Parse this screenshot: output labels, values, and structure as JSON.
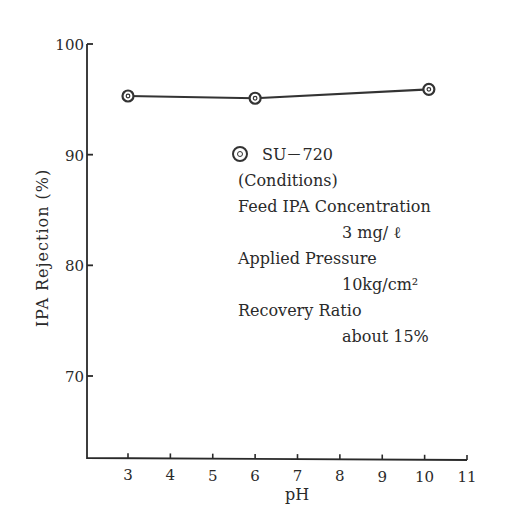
{
  "chart_data": {
    "type": "line",
    "title": "",
    "xlabel": "pH",
    "ylabel": "IPA Rejection (%)",
    "xlim": [
      2,
      11
    ],
    "ylim": [
      62.5,
      100
    ],
    "x_ticks": [
      "3",
      "4",
      "5",
      "6",
      "7",
      "8",
      "9",
      "10",
      "11"
    ],
    "y_ticks": [
      "100",
      "90",
      "80",
      "70"
    ],
    "grid": false,
    "legend_position": "inside-center-right",
    "series": [
      {
        "name": "SU-720",
        "marker": "double-circle",
        "x": [
          3,
          6,
          10.1
        ],
        "values": [
          95.3,
          95.1,
          95.9
        ]
      }
    ],
    "annotations": [
      "(Conditions)",
      "Feed IPA Concentration",
      "3 mg/ℓ",
      "Applied Pressure",
      "10kg/cm²",
      "Recovery Ratio",
      "about 15%"
    ]
  },
  "axes": {
    "x_title": "pH",
    "y_title": "IPA Rejection (%)"
  },
  "legend": {
    "series_label": "SU－720",
    "conditions_header": "(Conditions)",
    "feed_label": "Feed IPA Concentration",
    "feed_value": "3 mg/ ℓ",
    "pressure_label": "Applied Pressure",
    "pressure_value": "10kg/cm²",
    "recovery_label": "Recovery Ratio",
    "recovery_value": "about  15%"
  }
}
